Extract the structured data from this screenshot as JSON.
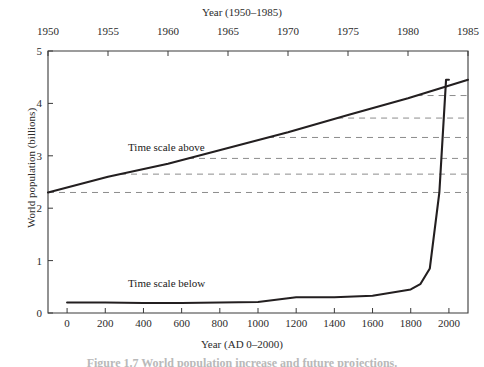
{
  "figure": {
    "caption": "Figure 1.7  World population increase and future projections.",
    "top_axis_title": "Year (1950–1985)",
    "bottom_axis_title": "Year (AD 0–2000)",
    "y_axis_title": "World population (billions)",
    "annotation_above": "Time scale above",
    "annotation_below": "Time scale below",
    "line_color": "#231f20",
    "dash_color": "#8c8c8c",
    "axis_color": "#3a3a3a"
  },
  "chart_data": {
    "type": "line",
    "title": "",
    "xlabel": "Year (AD 0–2000)",
    "ylabel": "World population (billions)",
    "ylim": [
      0,
      5
    ],
    "yticks": [
      0,
      1,
      2,
      3,
      4,
      5
    ],
    "ytick_labels": [
      "0",
      "1",
      "2",
      "3",
      "4",
      "5"
    ],
    "grid": false,
    "legend_position": "inline-annotations",
    "axes": [
      {
        "name": "top",
        "label": "Year (1950–1985)",
        "xlim": [
          1950,
          1985
        ],
        "ticks": [
          1950,
          1955,
          1960,
          1965,
          1970,
          1975,
          1980,
          1985
        ],
        "tick_labels": [
          "1950",
          "1955",
          "1960",
          "1965",
          "1970",
          "1975",
          "1980",
          "1985"
        ]
      },
      {
        "name": "bottom",
        "label": "Year (AD 0–2000)",
        "xlim": [
          -100,
          2100
        ],
        "ticks": [
          0,
          200,
          400,
          600,
          800,
          1000,
          1200,
          1400,
          1600,
          1800,
          2000
        ],
        "tick_labels": [
          "0",
          "200",
          "400",
          "600",
          "800",
          "1000",
          "1200",
          "1400",
          "1600",
          "1800",
          "2000"
        ]
      }
    ],
    "series": [
      {
        "name": "Time scale above",
        "axis": "top",
        "annotation": "Time scale above",
        "x": [
          1950,
          1955,
          1960,
          1965,
          1970,
          1975,
          1980,
          1985
        ],
        "values": [
          2.3,
          2.6,
          2.85,
          3.15,
          3.45,
          3.78,
          4.1,
          4.45
        ]
      },
      {
        "name": "Time scale below",
        "axis": "bottom",
        "annotation": "Time scale below",
        "x": [
          0,
          200,
          400,
          600,
          800,
          1000,
          1200,
          1400,
          1600,
          1800,
          1850,
          1900,
          1950,
          1985,
          2000
        ],
        "values": [
          0.2,
          0.2,
          0.19,
          0.19,
          0.2,
          0.21,
          0.3,
          0.3,
          0.33,
          0.45,
          0.55,
          0.85,
          2.3,
          4.45,
          4.45
        ]
      }
    ],
    "reference_lines": {
      "style": "dashed",
      "description": "Horizontal dashed leaders joining points on the upper curve to the right edge",
      "values": [
        2.3,
        2.65,
        2.95,
        3.35,
        3.72,
        4.15
      ]
    }
  }
}
